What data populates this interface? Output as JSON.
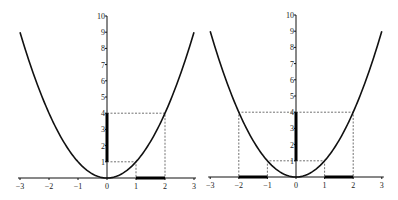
{
  "chart_data": [
    {
      "type": "line",
      "title": "",
      "function": "y = x^2",
      "x_ticks": [
        "-3",
        "-2",
        "-1",
        "0",
        "1",
        "2",
        "3"
      ],
      "y_ticks": [
        "1",
        "2",
        "3",
        "4",
        "5",
        "6",
        "7",
        "8",
        "9",
        "10"
      ],
      "xlim": [
        -3,
        3
      ],
      "ylim": [
        0,
        10
      ],
      "grid": false,
      "highlighted_x_interval": [
        1,
        2
      ],
      "highlighted_y_interval": [
        1,
        4
      ],
      "guide_points": [
        [
          1,
          1
        ],
        [
          2,
          4
        ]
      ]
    },
    {
      "type": "line",
      "title": "",
      "function": "y = x^2",
      "x_ticks": [
        "-3",
        "-2",
        "-1",
        "0",
        "1",
        "2",
        "3"
      ],
      "y_ticks": [
        "1",
        "2",
        "3",
        "4",
        "5",
        "6",
        "7",
        "8",
        "9",
        "10"
      ],
      "xlim": [
        -3,
        3
      ],
      "ylim": [
        0,
        10
      ],
      "grid": false,
      "highlighted_x_intervals": [
        [
          -2,
          -1
        ],
        [
          1,
          2
        ]
      ],
      "highlighted_y_interval": [
        1,
        4
      ],
      "guide_points": [
        [
          -2,
          4
        ],
        [
          -1,
          1
        ],
        [
          1,
          1
        ],
        [
          2,
          4
        ]
      ]
    }
  ],
  "plots": [
    {
      "x_ticks": [
        "-3",
        "-2",
        "-1",
        "0",
        "1",
        "2",
        "3"
      ],
      "y_ticks": [
        "1",
        "2",
        "3",
        "4",
        "5",
        "6",
        "7",
        "8",
        "9",
        "10"
      ]
    },
    {
      "x_ticks": [
        "-3",
        "-2",
        "-1",
        "0",
        "1",
        "2",
        "3"
      ],
      "y_ticks": [
        "1",
        "2",
        "3",
        "4",
        "5",
        "6",
        "7",
        "8",
        "9",
        "10"
      ]
    }
  ]
}
